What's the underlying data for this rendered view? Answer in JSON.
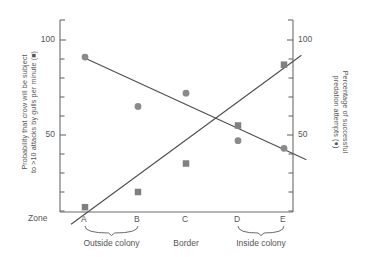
{
  "chart_data": {
    "type": "scatter",
    "title": "",
    "xlabel": "Zone",
    "categories": [
      "A",
      "B",
      "C",
      "D",
      "E"
    ],
    "x": [
      1,
      2,
      3,
      4,
      5
    ],
    "grid": false,
    "legend_position": "in-axis-labels",
    "left_axis": {
      "label": "Probability that crow will be subject to >10 attacks by gulls per minute (■)",
      "label_line1": "Probability that crow will be subject",
      "label_line2": "to >10 attacks by gulls per minute (■)",
      "ticks": [
        50,
        100
      ],
      "tick_labels": [
        "50",
        "100"
      ],
      "ylim": [
        0,
        100
      ],
      "minor_tick_count": 9
    },
    "right_axis": {
      "label": "Percentage of successful predation attempts (●)",
      "label_line1": "Percentage of successful",
      "label_line2": "predation attempts (●)",
      "ticks": [
        50,
        100
      ],
      "tick_labels": [
        "50",
        "100"
      ],
      "ylim": [
        0,
        100
      ],
      "minor_tick_count": 9
    },
    "series": [
      {
        "name": "Probability that crow will be subject to >10 attacks by gulls per minute",
        "marker": "square",
        "marker_symbol": "■",
        "axis": "left",
        "color": "#808080",
        "values": [
          12,
          20,
          35,
          55,
          87
        ],
        "trendline": {
          "x_start": 0.72,
          "y_start": 3,
          "x_end": 5.35,
          "y_end": 92
        }
      },
      {
        "name": "Percentage of successful predation attempts",
        "marker": "circle",
        "marker_symbol": "●",
        "axis": "right",
        "color": "#8a8a8a",
        "values": [
          91,
          65,
          72,
          47,
          43
        ],
        "trendline": {
          "x_start": 0.95,
          "y_start": 91,
          "x_end": 5.45,
          "y_end": 37
        }
      }
    ],
    "zone_groups": [
      {
        "label": "Outside colony",
        "zones": [
          "A",
          "B"
        ]
      },
      {
        "label": "Border",
        "zones": [
          "C"
        ]
      },
      {
        "label": "Inside colony",
        "zones": [
          "D",
          "E"
        ]
      }
    ],
    "colors": {
      "axis": "#6b6b6b",
      "trendline": "#4d4d4d",
      "square_marker": "#808080",
      "circle_marker": "#8a8a8a",
      "text": "#555555"
    }
  },
  "axis_caption": "Zone"
}
